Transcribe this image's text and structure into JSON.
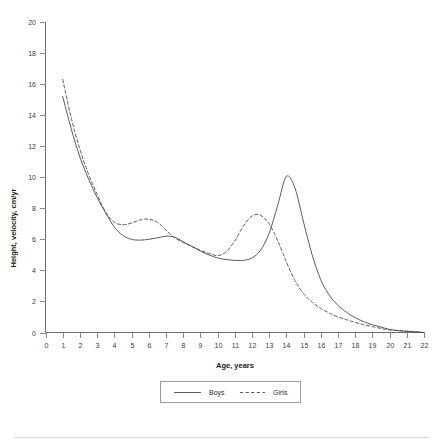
{
  "chart_data": {
    "type": "line",
    "title": "",
    "xlabel": "Age, years",
    "ylabel": "Height, velocity, cm/yr",
    "xlim": [
      0,
      22
    ],
    "ylim": [
      0,
      20
    ],
    "xticks": [
      0,
      1,
      2,
      3,
      4,
      5,
      6,
      7,
      8,
      9,
      10,
      11,
      12,
      13,
      14,
      15,
      16,
      17,
      18,
      19,
      20,
      21,
      22
    ],
    "yticks": [
      0,
      2,
      4,
      6,
      8,
      10,
      12,
      14,
      16,
      18,
      20
    ],
    "grid": false,
    "legend_position": "bottom",
    "x": [
      1,
      1.5,
      2,
      2.5,
      3,
      3.5,
      4,
      4.5,
      5,
      5.5,
      6,
      6.5,
      7,
      7.5,
      8,
      8.5,
      9,
      9.5,
      10,
      10.5,
      11,
      11.5,
      12,
      12.5,
      13,
      13.5,
      14,
      14.5,
      15,
      15.5,
      16,
      16.5,
      17,
      17.5,
      18,
      18.5,
      19,
      19.5,
      20,
      20.5,
      21,
      21.5,
      22
    ],
    "series": [
      {
        "name": "Boys",
        "style": "solid",
        "color": "#4a4a4a",
        "values": [
          15.2,
          13.1,
          11.3,
          9.9,
          8.7,
          7.7,
          6.8,
          6.25,
          6.0,
          5.95,
          6.0,
          6.1,
          6.2,
          6.15,
          5.85,
          5.55,
          5.25,
          5.0,
          4.8,
          4.7,
          4.65,
          4.65,
          4.8,
          5.3,
          6.4,
          8.2,
          10.05,
          9.3,
          7.1,
          5.0,
          3.4,
          2.4,
          1.75,
          1.3,
          0.95,
          0.7,
          0.5,
          0.35,
          0.2,
          0.12,
          0.07,
          0.04,
          0.0
        ]
      },
      {
        "name": "Girls",
        "style": "dashed",
        "color": "#4a4a4a",
        "values": [
          16.3,
          13.8,
          11.8,
          10.2,
          8.9,
          7.75,
          7.1,
          6.95,
          7.05,
          7.25,
          7.3,
          7.1,
          6.6,
          6.1,
          5.8,
          5.55,
          5.3,
          5.1,
          4.95,
          5.2,
          5.9,
          6.85,
          7.5,
          7.55,
          7.0,
          5.9,
          4.55,
          3.35,
          2.5,
          1.95,
          1.55,
          1.25,
          1.0,
          0.82,
          0.65,
          0.5,
          0.38,
          0.26,
          0.16,
          0.12,
          0.09,
          0.05,
          0.0
        ]
      }
    ],
    "annotations": {
      "boys_peak_age": 14,
      "boys_peak_value": 10.05,
      "girls_peak_age": 12.5,
      "girls_peak_value": 7.55,
      "girls_midchildhood_bump_age": 6,
      "girls_midchildhood_bump_value": 7.3
    }
  },
  "legend": {
    "entries": [
      {
        "label": "Boys",
        "style": "solid"
      },
      {
        "label": "Girls",
        "style": "dashed"
      }
    ]
  }
}
